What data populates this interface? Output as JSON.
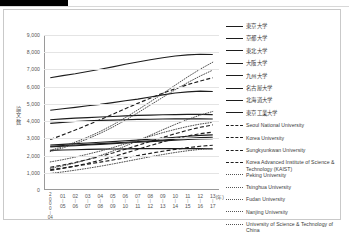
{
  "page": {
    "redaction_bar": "",
    "figure_border_color": "#c9c9c9"
  },
  "chart_data": {
    "type": "line",
    "title": "",
    "xlabel": "(年)",
    "ylabel": "論文数",
    "ylim": [
      0,
      9000
    ],
    "ytick_labels": [
      "9,000",
      "8,000",
      "7,000",
      "6,000",
      "5,000",
      "4,000",
      "3,000",
      "2,000",
      "1,000",
      "0"
    ],
    "ytick_values": [
      9000,
      8000,
      7000,
      6000,
      5000,
      4000,
      3000,
      2000,
      1000,
      0
    ],
    "grid": true,
    "legend_position": "right",
    "x_unit_label": "(年)",
    "x_first_label_top": "2000",
    "x_first_label_bottom": "04",
    "categories": [
      "2000-04",
      "01-05",
      "02-06",
      "03-07",
      "04-08",
      "05-09",
      "06-10",
      "07-11",
      "08-12",
      "09-13",
      "10-14",
      "11-15",
      "12-16",
      "13-17"
    ],
    "xtick_top": [
      "2000",
      "01",
      "02",
      "03",
      "04",
      "05",
      "06",
      "07",
      "08",
      "09",
      "10",
      "11",
      "12",
      "13"
    ],
    "xtick_bottom": [
      "04",
      "05",
      "06",
      "07",
      "08",
      "09",
      "10",
      "11",
      "12",
      "13",
      "14",
      "15",
      "16",
      "17"
    ],
    "series": [
      {
        "name": "東京大学",
        "style": "solid",
        "lang": "jp",
        "values": [
          6520,
          6640,
          6750,
          6880,
          7010,
          7150,
          7300,
          7430,
          7560,
          7680,
          7780,
          7850,
          7880,
          7870
        ]
      },
      {
        "name": "京都大学",
        "style": "solid",
        "lang": "jp",
        "values": [
          4630,
          4720,
          4800,
          4890,
          4970,
          5070,
          5180,
          5280,
          5400,
          5520,
          5630,
          5700,
          5740,
          5720
        ]
      },
      {
        "name": "東北大学",
        "style": "solid",
        "lang": "jp",
        "values": [
          4080,
          4130,
          4170,
          4200,
          4240,
          4270,
          4300,
          4330,
          4350,
          4370,
          4380,
          4390,
          4390,
          4380
        ]
      },
      {
        "name": "大阪大学",
        "style": "solid",
        "lang": "jp",
        "values": [
          3870,
          3930,
          3980,
          4010,
          4040,
          4060,
          4080,
          4100,
          4110,
          4120,
          4130,
          4130,
          4130,
          4120
        ]
      },
      {
        "name": "九州大学",
        "style": "solid",
        "lang": "jp",
        "values": [
          2610,
          2650,
          2690,
          2730,
          2770,
          2810,
          2860,
          2900,
          2950,
          3000,
          3060,
          3120,
          3170,
          3200
        ]
      },
      {
        "name": "名古屋大学",
        "style": "solid",
        "lang": "jp",
        "values": [
          2540,
          2580,
          2610,
          2650,
          2690,
          2730,
          2770,
          2810,
          2860,
          2900,
          2950,
          3000,
          3040,
          3060
        ]
      },
      {
        "name": "北海道大学",
        "style": "solid",
        "lang": "jp",
        "values": [
          2500,
          2540,
          2570,
          2610,
          2650,
          2690,
          2730,
          2770,
          2810,
          2850,
          2890,
          2930,
          2960,
          2980
        ]
      },
      {
        "name": "東京工業大学",
        "style": "solid",
        "lang": "jp",
        "values": [
          2300,
          2320,
          2340,
          2360,
          2370,
          2380,
          2390,
          2400,
          2400,
          2400,
          2400,
          2400,
          2400,
          2390
        ]
      },
      {
        "name": "Seoul National University",
        "style": "dash",
        "lang": "en",
        "values": [
          2930,
          3200,
          3480,
          3780,
          4080,
          4400,
          4720,
          5030,
          5330,
          5620,
          5880,
          6120,
          6330,
          6520
        ]
      },
      {
        "name": "Korea University",
        "style": "dash",
        "lang": "en",
        "values": [
          1320,
          1450,
          1600,
          1770,
          1950,
          2150,
          2370,
          2590,
          2820,
          3050,
          3270,
          3470,
          3640,
          3780
        ]
      },
      {
        "name": "Sungkyunkwan University",
        "style": "dash",
        "lang": "en",
        "values": [
          1130,
          1250,
          1390,
          1550,
          1730,
          1930,
          2140,
          2360,
          2580,
          2790,
          2980,
          3140,
          3270,
          3360
        ]
      },
      {
        "name": "Korea Advanced Institute of Science & Technology (KAIST)",
        "style": "dash",
        "lang": "en",
        "values": [
          1180,
          1280,
          1390,
          1500,
          1620,
          1740,
          1870,
          2000,
          2130,
          2250,
          2360,
          2460,
          2540,
          2600
        ]
      },
      {
        "name": "Peking University",
        "style": "dot",
        "lang": "en",
        "values": [
          2300,
          2520,
          2780,
          3070,
          3400,
          3780,
          4200,
          4650,
          5120,
          5600,
          6090,
          6570,
          7020,
          7420
        ]
      },
      {
        "name": "Tsinghua University",
        "style": "dot",
        "lang": "en",
        "values": [
          2230,
          2440,
          2690,
          2970,
          3290,
          3650,
          4050,
          4480,
          4930,
          5380,
          5820,
          6240,
          6620,
          6960
        ]
      },
      {
        "name": "Fudan University",
        "style": "dot",
        "lang": "en",
        "values": [
          1260,
          1400,
          1570,
          1770,
          2000,
          2260,
          2550,
          2860,
          3180,
          3500,
          3810,
          4100,
          4350,
          4560
        ]
      },
      {
        "name": "Nanjing University",
        "style": "dot",
        "lang": "en",
        "values": [
          1630,
          1760,
          1910,
          2080,
          2260,
          2460,
          2680,
          2900,
          3120,
          3330,
          3520,
          3690,
          3830,
          3930
        ]
      },
      {
        "name": "University of Science & Technology of China",
        "style": "dot",
        "lang": "en",
        "values": [
          960,
          1050,
          1150,
          1260,
          1380,
          1510,
          1650,
          1790,
          1930,
          2060,
          2180,
          2280,
          2360,
          2420
        ]
      }
    ]
  }
}
